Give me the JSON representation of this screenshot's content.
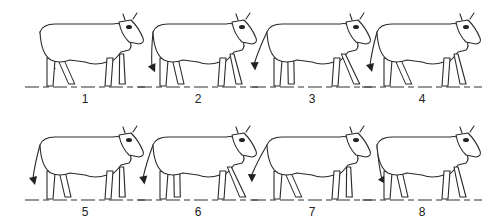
{
  "figure": {
    "colors": {
      "ink": "#222222",
      "background": "#ffffff"
    },
    "panels": [
      {
        "label": "1",
        "row": 1,
        "x": 25,
        "y": 0,
        "tail_angle": -30,
        "front_leg": "forward",
        "hind_leg": "back"
      },
      {
        "label": "2",
        "row": 1,
        "x": 138,
        "y": 0,
        "tail_angle": -10,
        "front_leg": "mid",
        "hind_leg": "mid"
      },
      {
        "label": "3",
        "row": 1,
        "x": 252,
        "y": 0,
        "tail_angle": 10,
        "front_leg": "back",
        "hind_leg": "forward"
      },
      {
        "label": "4",
        "row": 1,
        "x": 362,
        "y": 0,
        "tail_angle": 0,
        "front_leg": "mid",
        "hind_leg": "back"
      },
      {
        "label": "5",
        "row": 2,
        "x": 25,
        "y": 113,
        "tail_angle": 0,
        "front_leg": "forward",
        "hind_leg": "mid"
      },
      {
        "label": "6",
        "row": 2,
        "x": 138,
        "y": 113,
        "tail_angle": 5,
        "front_leg": "back",
        "hind_leg": "forward"
      },
      {
        "label": "7",
        "row": 2,
        "x": 252,
        "y": 113,
        "tail_angle": 15,
        "front_leg": "forward",
        "hind_leg": "back"
      },
      {
        "label": "8",
        "row": 2,
        "x": 362,
        "y": 113,
        "tail_angle": -20,
        "front_leg": "mid",
        "hind_leg": "mid"
      }
    ]
  }
}
